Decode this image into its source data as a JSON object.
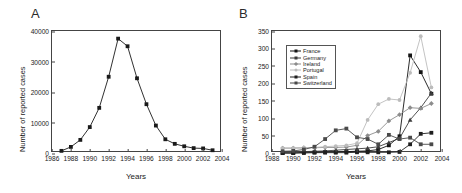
{
  "figure": {
    "panels": [
      {
        "label": "A",
        "xlabel": "Years",
        "ylabel": "Number of reported cases"
      },
      {
        "label": "B",
        "xlabel": "Years",
        "ylabel": "Number of reported cases"
      }
    ]
  },
  "chart_data": [
    {
      "type": "line",
      "title": "",
      "panel": "A",
      "xlabel": "Years",
      "ylabel": "Number of reported cases",
      "xlim": [
        1986,
        2004
      ],
      "ylim": [
        0,
        40000
      ],
      "xticks": [
        1986,
        1988,
        1990,
        1992,
        1994,
        1996,
        1998,
        2000,
        2002,
        2004
      ],
      "yticks": [
        0,
        10000,
        20000,
        30000,
        40000
      ],
      "grid": false,
      "legend": "none",
      "marker": "square",
      "color": "#1a1a1a",
      "x": [
        1987,
        1988,
        1989,
        1990,
        1991,
        1992,
        1993,
        1994,
        1995,
        1996,
        1997,
        1998,
        1999,
        2000,
        2001,
        2002,
        2003
      ],
      "values": [
        700,
        2000,
        4300,
        8500,
        14800,
        25000,
        37500,
        35000,
        24500,
        16000,
        9000,
        4500,
        3000,
        2200,
        1600,
        1500,
        900
      ]
    },
    {
      "type": "line",
      "title": "",
      "panel": "B",
      "xlabel": "Years",
      "ylabel": "Number of reported cases",
      "xlim": [
        1988,
        2004
      ],
      "ylim": [
        0,
        350
      ],
      "xticks": [
        1988,
        1990,
        1992,
        1994,
        1996,
        1998,
        2000,
        2002,
        2004
      ],
      "yticks": [
        0,
        50,
        100,
        150,
        200,
        250,
        300,
        350
      ],
      "grid": false,
      "legend_position": "upper-left",
      "x": [
        1989,
        1990,
        1991,
        1992,
        1993,
        1994,
        1995,
        1996,
        1997,
        1998,
        1999,
        2000,
        2001,
        2002,
        2003
      ],
      "series": [
        {
          "name": "France",
          "color": "#141414",
          "marker": "square",
          "values": [
            0,
            0,
            2,
            2,
            3,
            3,
            4,
            5,
            6,
            10,
            22,
            48,
            280,
            232,
            170
          ]
        },
        {
          "name": "Germany",
          "color": "#3c3c3c",
          "marker": "triangle",
          "values": [
            2,
            3,
            4,
            5,
            6,
            8,
            10,
            12,
            14,
            18,
            30,
            42,
            95,
            130,
            172
          ]
        },
        {
          "name": "Ireland",
          "color": "#8c8c8c",
          "marker": "diamond",
          "values": [
            14,
            14,
            15,
            15,
            16,
            16,
            17,
            22,
            50,
            62,
            92,
            110,
            130,
            128,
            142
          ]
        },
        {
          "name": "Portugal",
          "color": "#bcbcbc",
          "marker": "circle",
          "values": [
            14,
            14,
            15,
            16,
            18,
            20,
            22,
            28,
            95,
            140,
            155,
            152,
            230,
            335,
            188
          ]
        },
        {
          "name": "Spain",
          "color": "#1f1f1f",
          "marker": "square",
          "values": [
            0,
            0,
            0,
            1,
            1,
            1,
            1,
            2,
            2,
            2,
            2,
            3,
            25,
            55,
            58
          ]
        },
        {
          "name": "Switzerland",
          "color": "#4a4a4a",
          "marker": "square",
          "values": [
            5,
            6,
            10,
            18,
            40,
            65,
            70,
            45,
            40,
            25,
            52,
            40,
            44,
            25,
            25
          ]
        }
      ]
    }
  ]
}
